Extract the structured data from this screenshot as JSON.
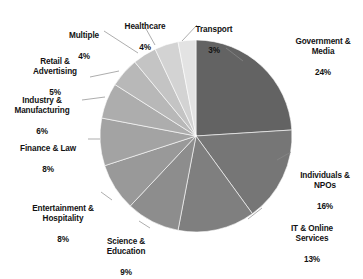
{
  "chart_data": {
    "type": "pie",
    "title": "",
    "subtitle": "",
    "xlabel": "",
    "ylabel": "",
    "legend_position": "none",
    "grid": false,
    "label_format": "name + percent",
    "start_angle_deg": 0,
    "direction": "clockwise",
    "total_percent": 100,
    "categories": [
      "Government & Media",
      "Individuals & NPOs",
      "IT & Online Services",
      "Science & Education",
      "Entertainment & Hospitality",
      "Finance & Law",
      "Industry & Manufacturing",
      "Retail & Advertising",
      "Multiple",
      "Healthcare",
      "Transport"
    ],
    "values": [
      24,
      16,
      13,
      9,
      8,
      8,
      6,
      5,
      4,
      4,
      3
    ],
    "colors": [
      "#636363",
      "#767676",
      "#7f7f7f",
      "#8d8d8d",
      "#999999",
      "#a3a3a3",
      "#adadad",
      "#b8b8b8",
      "#c4c4c4",
      "#d3d3d3",
      "#e3e3e3"
    ],
    "slices": [
      {
        "label": "Government & Media",
        "value": 24,
        "percent_text": "24%",
        "color": "#636363"
      },
      {
        "label": "Individuals & NPOs",
        "value": 16,
        "percent_text": "16%",
        "color": "#767676"
      },
      {
        "label": "IT & Online Services",
        "value": 13,
        "percent_text": "13%",
        "color": "#7f7f7f"
      },
      {
        "label": "Science & Education",
        "value": 9,
        "percent_text": "9%",
        "color": "#8d8d8d"
      },
      {
        "label": "Entertainment & Hospitality",
        "value": 8,
        "percent_text": "8%",
        "color": "#999999"
      },
      {
        "label": "Finance & Law",
        "value": 8,
        "percent_text": "8%",
        "color": "#a3a3a3"
      },
      {
        "label": "Industry & Manufacturing",
        "value": 6,
        "percent_text": "6%",
        "color": "#adadad"
      },
      {
        "label": "Retail & Advertising",
        "value": 5,
        "percent_text": "5%",
        "color": "#b8b8b8"
      },
      {
        "label": "Multiple",
        "value": 4,
        "percent_text": "4%",
        "color": "#c4c4c4"
      },
      {
        "label": "Healthcare",
        "value": 4,
        "percent_text": "4%",
        "color": "#d3d3d3"
      },
      {
        "label": "Transport",
        "value": 3,
        "percent_text": "3%",
        "color": "#e3e3e3"
      }
    ]
  },
  "labels": {
    "government_media": {
      "name": "Government &\nMedia",
      "pct": "24%"
    },
    "individuals_npos": {
      "name": "Individuals &\nNPOs",
      "pct": "16%"
    },
    "it_online": {
      "name": "IT & Online\nServices",
      "pct": "13%"
    },
    "science_education": {
      "name": "Science &\nEducation",
      "pct": "9%"
    },
    "entertainment": {
      "name": "Entertainment &\nHospitality",
      "pct": "8%"
    },
    "finance_law": {
      "name": "Finance & Law",
      "pct": "8%"
    },
    "industry": {
      "name": "Industry &\nManufacturing",
      "pct": "6%"
    },
    "retail": {
      "name": "Retail &\nAdvertising",
      "pct": "5%"
    },
    "multiple": {
      "name": "Multiple",
      "pct": "4%"
    },
    "healthcare": {
      "name": "Healthcare",
      "pct": "4%"
    },
    "transport": {
      "name": "Transport",
      "pct": "3%"
    }
  },
  "style": {
    "background": "#ffffff",
    "text_color": "#121212",
    "leader_color": "#8a8a8a"
  }
}
